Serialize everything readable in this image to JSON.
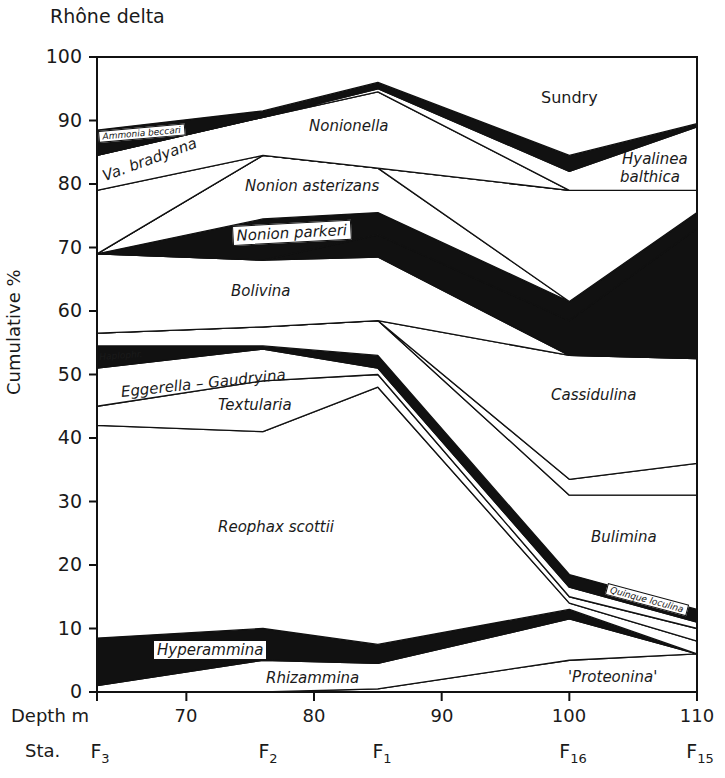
{
  "title": "Rhône delta",
  "chart_data": {
    "type": "area",
    "title": "Rhône delta",
    "xlabel": "Depth m",
    "ylabel": "Cumulative %",
    "ylim": [
      0,
      100
    ],
    "xlim": [
      63,
      110
    ],
    "yticks": [
      0,
      10,
      20,
      30,
      40,
      50,
      60,
      70,
      80,
      90,
      100
    ],
    "xticks": [
      70,
      80,
      90,
      100,
      110
    ],
    "stations": [
      {
        "name": "F",
        "sub": "3",
        "depth": 63
      },
      {
        "name": "F",
        "sub": "2",
        "depth": 76
      },
      {
        "name": "F",
        "sub": "1",
        "depth": 85
      },
      {
        "name": "F",
        "sub": "16",
        "depth": 100
      },
      {
        "name": "F",
        "sub": "15",
        "depth": 110
      }
    ],
    "x": [
      63,
      76,
      85,
      100,
      110
    ],
    "series_note": "Cumulative upper boundary (%) of each band at stations F3, F2, F1, F16, F15",
    "series": [
      {
        "name": "'Proteonina'",
        "fill": "#ffffff",
        "upper": [
          0,
          0,
          0.5,
          5,
          6
        ]
      },
      {
        "name": "Rhizammina",
        "fill": "#ffffff",
        "upper": [
          1,
          5,
          4.5,
          11.5,
          6
        ]
      },
      {
        "name": "Hyperammina",
        "fill": "#111111",
        "upper": [
          8.5,
          10,
          7.5,
          13,
          6
        ]
      },
      {
        "name": "Reophax scottii",
        "fill": "#ffffff",
        "upper": [
          42,
          41,
          48,
          14,
          8
        ]
      },
      {
        "name": "Textularia",
        "fill": "#ffffff",
        "upper": [
          45,
          49,
          50,
          15,
          10
        ]
      },
      {
        "name": "Eggerella - Gaudryina",
        "fill": "#ffffff",
        "upper": [
          51,
          54,
          51,
          16.5,
          11
        ]
      },
      {
        "name": "Quinqueloculina",
        "fill": "#111111",
        "upper": [
          54.5,
          54.5,
          53,
          18.5,
          13
        ]
      },
      {
        "name": "Haplophr.",
        "fill": "#ffffff",
        "upper": [
          54.5,
          54.5,
          53,
          18.5,
          13
        ]
      },
      {
        "name": "Bulimina",
        "fill": "#ffffff",
        "upper": [
          56.5,
          57.5,
          58.5,
          31,
          31
        ]
      },
      {
        "name": "Cassidulina",
        "fill": "#ffffff",
        "upper": [
          56.5,
          57.5,
          58.5,
          33.5,
          36
        ]
      },
      {
        "name": "Cassidulina (cont.)",
        "fill": "#ffffff",
        "upper": [
          56.5,
          57.5,
          58.5,
          53,
          52.5
        ]
      },
      {
        "name": "Bolivina",
        "fill": "#ffffff",
        "upper": [
          69,
          68,
          68.5,
          53,
          52.5
        ]
      },
      {
        "name": "black band",
        "fill": "#111111",
        "upper": [
          69,
          68,
          72,
          58.5,
          73
        ]
      },
      {
        "name": "Nonion parkeri",
        "fill": "#111111",
        "upper": [
          69,
          74.5,
          75.5,
          61.5,
          75.5
        ]
      },
      {
        "name": "Nonion asterizans",
        "fill": "#ffffff",
        "upper": [
          69,
          84.5,
          82.5,
          61.5,
          75.5
        ]
      },
      {
        "name": "Hyalinea balthica",
        "fill": "#ffffff",
        "upper": [
          69,
          84.5,
          82.5,
          79,
          79
        ]
      },
      {
        "name": "Va. bradyana",
        "fill": "#ffffff",
        "upper": [
          79,
          84.5,
          82.5,
          79,
          79
        ]
      },
      {
        "name": "Nonionella",
        "fill": "#ffffff",
        "upper": [
          84.5,
          90.5,
          94.5,
          79,
          79
        ]
      },
      {
        "name": "Nonionella thin",
        "fill": "#ffffff",
        "upper": [
          84.5,
          90.5,
          95,
          82,
          89
        ]
      },
      {
        "name": "Ammonia beccarii",
        "fill": "#111111",
        "upper": [
          88.5,
          91.5,
          96,
          84.5,
          89.5
        ]
      },
      {
        "name": "Sundry",
        "fill": "#ffffff",
        "upper": [
          100,
          100,
          100,
          100,
          100
        ]
      }
    ],
    "labels": [
      "Sundry",
      "Ammonia beccari",
      "Va. bradyana",
      "Nonionella",
      "Hyalinea balthica",
      "Nonion asterizans",
      "Nonion parkeri",
      "Bolivina",
      "Haplophr.",
      "Eggerella - Gaudryina",
      "Textularia",
      "Cassidulina",
      "Reophax scottii",
      "Bulimina",
      "Quinque loculina",
      "Hyperammina",
      "Rhizammina",
      "'Proteonina'"
    ],
    "grid": false,
    "legend": "inline labels"
  },
  "axes": {
    "ylabel": "Cumulative %",
    "depth_label": "Depth m",
    "sta_label": "Sta.",
    "yticks": [
      "0",
      "10",
      "20",
      "30",
      "40",
      "50",
      "60",
      "70",
      "80",
      "90",
      "100"
    ],
    "xticks": [
      "70",
      "80",
      "90",
      "100",
      "110"
    ]
  },
  "band_labels": {
    "sundry": "Sundry",
    "ammonia": "Ammonia beccari",
    "bradyana": "Va. bradyana",
    "nonionella": "Nonionella",
    "hyalinea1": "Hyalinea",
    "hyalinea2": "balthica",
    "asterizans": "Nonion asterizans",
    "parkeri": "Nonion parkeri",
    "bolivina": "Bolivina",
    "haplophr": "Haplophr.",
    "eggerella": "Eggerella – Gaudryina",
    "textularia": "Textularia",
    "cassidulina": "Cassidulina",
    "reophax": "Reophax scottii",
    "bulimina": "Bulimina",
    "quinque": "Quinque loculina",
    "hyperammina": "Hyperammina",
    "rhizammina": "Rhizammina",
    "proteonina": "'Proteonina'"
  }
}
